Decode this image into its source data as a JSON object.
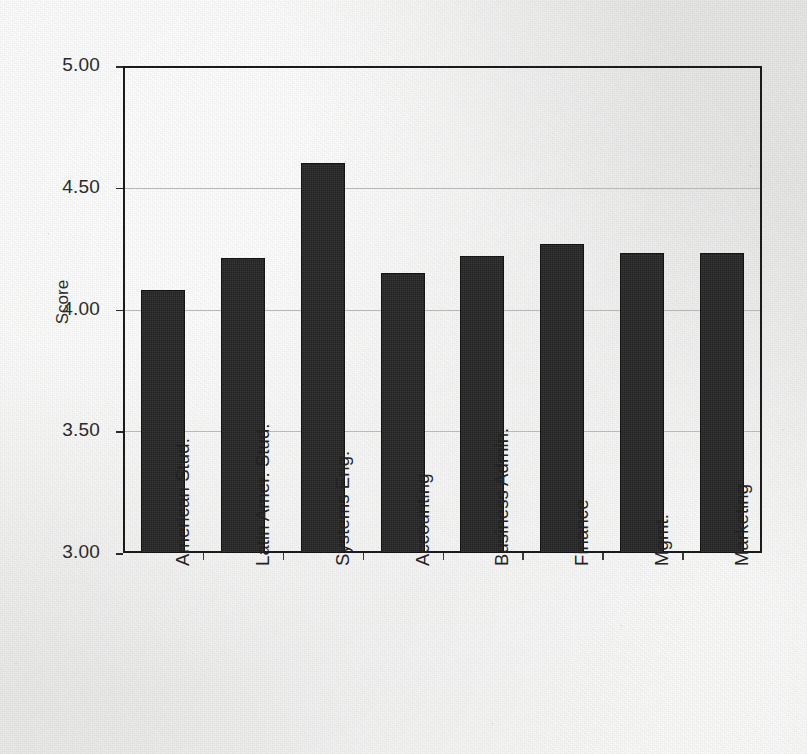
{
  "chart_data": {
    "type": "bar",
    "title": "",
    "subtitle": "",
    "xlabel": "",
    "ylabel": "Score",
    "ylim": [
      3.0,
      5.0
    ],
    "yticks": [
      "3.00",
      "3.50",
      "4.00",
      "4.50",
      "5.00"
    ],
    "ytick_values": [
      3.0,
      3.5,
      4.0,
      4.5,
      5.0
    ],
    "grid": "horizontal",
    "legend": "none",
    "bar_color": "#262626",
    "background_color": "#eeeeec",
    "axis_color": "#1b1b1b",
    "gridline_color": "#b8b8b6",
    "categories": [
      "American Stud.",
      "Latin Amer. Stud.",
      "Systems Eng.",
      "Accounting",
      "Business Admin.",
      "Finance",
      "Mgmt.",
      "Marketing"
    ],
    "values": [
      4.08,
      4.21,
      4.6,
      4.15,
      4.22,
      4.27,
      4.23,
      4.23
    ]
  }
}
